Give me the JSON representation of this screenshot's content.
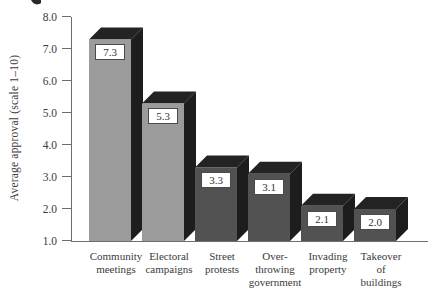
{
  "chart_data": {
    "type": "bar",
    "effect": "3d",
    "title": "",
    "xlabel": "",
    "ylabel": "Average approval (scale 1–10)",
    "ylim": [
      1.0,
      8.0
    ],
    "grid": false,
    "legend": false,
    "yticks": [
      "8.0",
      "7.0",
      "6.0",
      "5.0",
      "4.0",
      "3.0",
      "2.0",
      "1.0"
    ],
    "ytick_values": [
      8.0,
      7.0,
      6.0,
      5.0,
      4.0,
      3.0,
      2.0,
      1.0
    ],
    "categories": [
      "Community meetings",
      "Electoral campaigns",
      "Street protests",
      "Over-throwing government",
      "Invading property",
      "Takeover of buildings"
    ],
    "category_lines": [
      [
        "Community",
        "meetings"
      ],
      [
        "Electoral",
        "campaigns"
      ],
      [
        "Street",
        "protests"
      ],
      [
        "Over-",
        "throwing",
        "government"
      ],
      [
        "Invading",
        "property"
      ],
      [
        "Takeover",
        "of",
        "buildings"
      ]
    ],
    "values": [
      7.3,
      5.3,
      3.3,
      3.1,
      2.1,
      2.0
    ],
    "value_labels": [
      "7.3",
      "5.3",
      "3.3",
      "3.1",
      "2.1",
      "2.0"
    ],
    "colors": {
      "bar_front": [
        "#9b9b9b",
        "#9b9b9b",
        "#525252",
        "#525252",
        "#525252",
        "#525252"
      ],
      "bar_side": "#1d1d1d",
      "bar_top": "#232323",
      "axis": "#6e6e6e",
      "text": "#3b3b3b",
      "label_box_bg": "#ffffff",
      "label_box_border": "#4a4a4a"
    }
  }
}
